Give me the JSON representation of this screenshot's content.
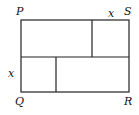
{
  "diagram": {
    "type": "rectangle-partition",
    "vertices": {
      "top_left": "P",
      "top_right": "S",
      "bottom_left": "Q",
      "bottom_right": "R"
    },
    "side_labels": {
      "top_right_segment": "x",
      "left_lower_segment": "x"
    },
    "colors": {
      "stroke": "#222222",
      "background": "#ffffff"
    }
  }
}
